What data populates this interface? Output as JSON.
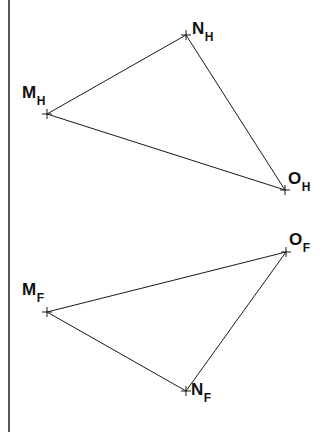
{
  "figure": {
    "background_color": "#ffffff",
    "line_color": "#1a1a1a",
    "frame_color": "#111111",
    "width": 334,
    "height": 432,
    "type": "descriptive-geometry-projection"
  },
  "frame": {
    "left_rule": {
      "x": 9,
      "y1": 0,
      "y2": 432
    }
  },
  "views": [
    {
      "id": "horizontal-projection",
      "subscript": "H",
      "vertices": [
        {
          "id": "M_H",
          "base": "M",
          "sub": "H",
          "x": 47,
          "y": 114,
          "label_x": 22,
          "label_y": 84,
          "marker": "cross"
        },
        {
          "id": "N_H",
          "base": "N",
          "sub": "H",
          "x": 186,
          "y": 35,
          "label_x": 192,
          "label_y": 20,
          "marker": "cross"
        },
        {
          "id": "O_H",
          "base": "O",
          "sub": "H",
          "x": 285,
          "y": 190,
          "label_x": 288,
          "label_y": 170,
          "marker": "cross"
        }
      ],
      "edges": [
        {
          "from": "M_H",
          "to": "N_H"
        },
        {
          "from": "N_H",
          "to": "O_H"
        },
        {
          "from": "O_H",
          "to": "M_H"
        }
      ]
    },
    {
      "id": "frontal-projection",
      "subscript": "F",
      "vertices": [
        {
          "id": "M_F",
          "base": "M",
          "sub": "F",
          "x": 47,
          "y": 312,
          "label_x": 22,
          "label_y": 281,
          "marker": "cross"
        },
        {
          "id": "N_F",
          "base": "N",
          "sub": "F",
          "x": 186,
          "y": 391,
          "label_x": 191,
          "label_y": 381,
          "marker": "cross"
        },
        {
          "id": "O_F",
          "base": "O",
          "sub": "F",
          "x": 286,
          "y": 252,
          "label_x": 289,
          "label_y": 231,
          "marker": "cross"
        }
      ],
      "edges": [
        {
          "from": "M_F",
          "to": "O_F"
        },
        {
          "from": "O_F",
          "to": "N_F"
        },
        {
          "from": "N_F",
          "to": "M_F"
        }
      ]
    }
  ],
  "marker_style": {
    "arm_length": 5,
    "stroke_width": 1
  }
}
